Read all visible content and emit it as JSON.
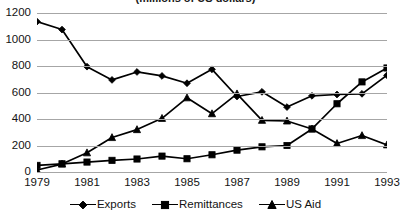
{
  "chart_data": {
    "type": "line",
    "title": "(millions of US dollars)",
    "xlabel": "",
    "ylabel": "",
    "x": [
      1979,
      1980,
      1981,
      1982,
      1983,
      1984,
      1985,
      1986,
      1987,
      1988,
      1989,
      1990,
      1991,
      1992,
      1993
    ],
    "categories": [
      "1979",
      "1980",
      "1981",
      "1982",
      "1983",
      "1984",
      "1985",
      "1986",
      "1987",
      "1988",
      "1989",
      "1990",
      "1991",
      "1992",
      "1993"
    ],
    "xtick_labels": [
      "1979",
      "1981",
      "1983",
      "1985",
      "1987",
      "1989",
      "1991",
      "1993"
    ],
    "xtick_values": [
      1979,
      1981,
      1983,
      1985,
      1987,
      1989,
      1991,
      1993
    ],
    "ytick_labels": [
      "0",
      "200",
      "400",
      "600",
      "800",
      "1000",
      "1200"
    ],
    "ytick_values": [
      0,
      200,
      400,
      600,
      800,
      1000,
      1200
    ],
    "ylim": [
      0,
      1200
    ],
    "xlim": [
      1979,
      1993
    ],
    "grid": "horizontal",
    "legend_position": "bottom",
    "series": [
      {
        "name": "Exports",
        "marker": "diamond",
        "color": "#000000",
        "values": [
          1135,
          1075,
          795,
          695,
          755,
          725,
          670,
          775,
          570,
          605,
          490,
          575,
          585,
          590,
          730
        ]
      },
      {
        "name": "Remittances",
        "marker": "square",
        "color": "#000000",
        "values": [
          50,
          62,
          75,
          88,
          98,
          120,
          100,
          130,
          165,
          190,
          200,
          325,
          515,
          680,
          785
        ]
      },
      {
        "name": "US Aid",
        "marker": "triangle",
        "color": "#000000",
        "values": [
          15,
          60,
          145,
          260,
          320,
          405,
          560,
          440,
          590,
          390,
          385,
          325,
          215,
          275,
          205
        ]
      }
    ]
  },
  "legend": {
    "items": [
      {
        "label": "Exports",
        "marker": "diamond"
      },
      {
        "label": "Remittances",
        "marker": "square"
      },
      {
        "label": "US Aid",
        "marker": "triangle"
      }
    ]
  }
}
